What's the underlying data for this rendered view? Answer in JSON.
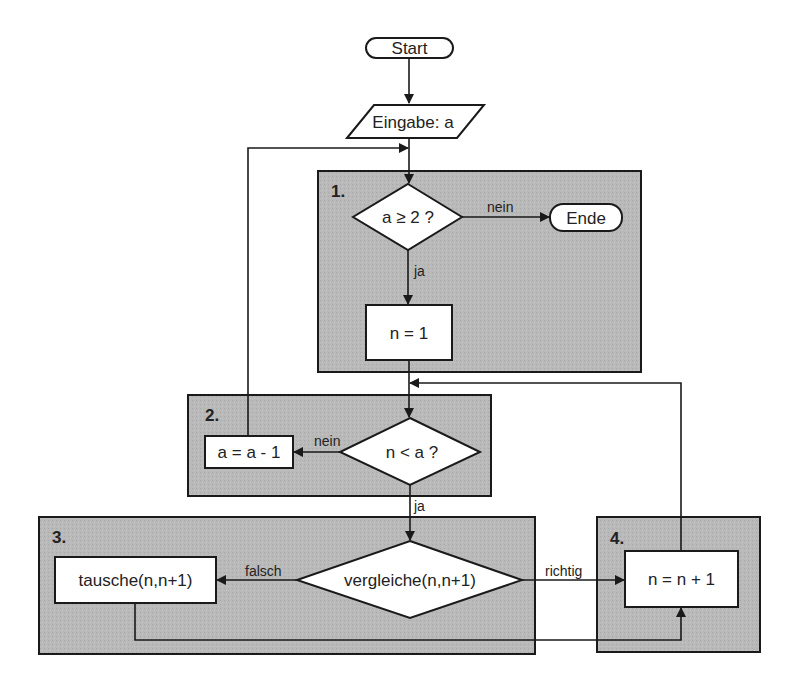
{
  "diagram": {
    "type": "flowchart",
    "colors": {
      "group_fill": "#b9b9b9",
      "node_fill": "#ffffff",
      "stroke": "#1a1a1a",
      "text": "#222222",
      "background": "#ffffff"
    },
    "nodes": {
      "start": {
        "label": "Start",
        "shape": "terminal"
      },
      "input": {
        "label": "Eingabe: a",
        "shape": "parallelogram"
      },
      "cond_a": {
        "label": "a ≥ 2 ?",
        "shape": "diamond"
      },
      "end": {
        "label": "Ende",
        "shape": "terminal"
      },
      "init_n": {
        "label": "n = 1",
        "shape": "process"
      },
      "cond_n": {
        "label": "n < a ?",
        "shape": "diamond"
      },
      "dec_a": {
        "label": "a = a - 1",
        "shape": "process"
      },
      "compare": {
        "label": "vergleiche(n,n+1)",
        "shape": "diamond"
      },
      "swap": {
        "label": "tausche(n,n+1)",
        "shape": "process"
      },
      "inc_n": {
        "label": "n = n + 1",
        "shape": "process"
      }
    },
    "groups": [
      {
        "id": "g1",
        "label": "1."
      },
      {
        "id": "g2",
        "label": "2."
      },
      {
        "id": "g3",
        "label": "3."
      },
      {
        "id": "g4",
        "label": "4."
      }
    ],
    "edges": {
      "cond_a_no": "nein",
      "cond_a_yes": "ja",
      "cond_n_no": "nein",
      "cond_n_yes": "ja",
      "compare_false": "falsch",
      "compare_true": "richtig"
    }
  }
}
